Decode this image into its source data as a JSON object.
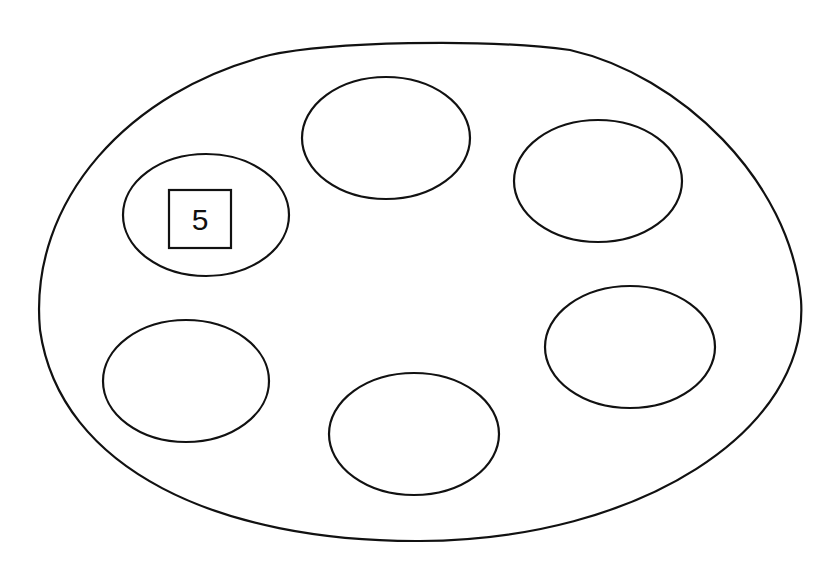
{
  "diagram": {
    "outer_shape": "large-oval",
    "circles": [
      {
        "id": "top-center",
        "cx": 386,
        "cy": 138,
        "rx": 84,
        "ry": 60,
        "label": ""
      },
      {
        "id": "top-right",
        "cx": 598,
        "cy": 181,
        "rx": 84,
        "ry": 60,
        "label": ""
      },
      {
        "id": "upper-left",
        "cx": 206,
        "cy": 215,
        "rx": 83,
        "ry": 61,
        "label": "5"
      },
      {
        "id": "lower-left",
        "cx": 186,
        "cy": 381,
        "rx": 83,
        "ry": 61,
        "label": ""
      },
      {
        "id": "bottom-center",
        "cx": 414,
        "cy": 435,
        "rx": 85,
        "ry": 61,
        "label": ""
      },
      {
        "id": "right",
        "cx": 630,
        "cy": 347,
        "rx": 85,
        "ry": 61,
        "label": ""
      }
    ],
    "box_label": "5",
    "stroke_color": "#111111",
    "background": "#ffffff"
  }
}
